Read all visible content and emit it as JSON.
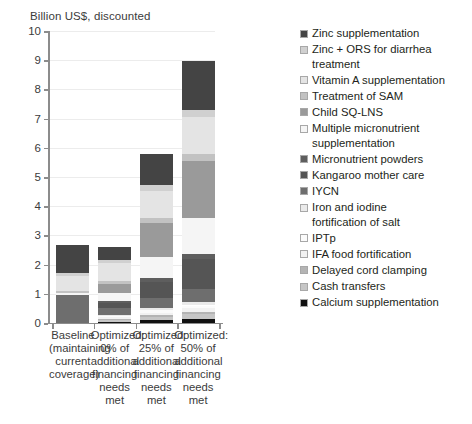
{
  "chart_data": {
    "type": "bar",
    "subtype": "stacked-vertical",
    "title": "Billion US$, discounted",
    "xlabel": "",
    "ylabel": "Billion US$, discounted",
    "ylim": [
      0,
      10
    ],
    "ytick_labels": [
      "0",
      "1",
      "2",
      "3",
      "4",
      "5",
      "6",
      "7",
      "8",
      "9",
      "10"
    ],
    "ytick_values": [
      0,
      1,
      2,
      3,
      4,
      5,
      6,
      7,
      8,
      9,
      10
    ],
    "grid": true,
    "legend_position": "right",
    "categories": [
      "Baseline\n(maintaining\ncurrent\ncoverage)",
      "Optimized:\n0% of\nadditional\nfinancing\nneeds met",
      "Optimized:\n25% of\nadditional\nfinancing\nneeds met",
      "Optimized:\n50% of\nadditional\nfinancing\nneeds met"
    ],
    "totals": [
      2.68,
      2.62,
      5.9,
      8.97
    ],
    "series": [
      {
        "name": "Calcium supplementation",
        "color": "#111111",
        "values": [
          0.0,
          0.05,
          0.1,
          0.13
        ]
      },
      {
        "name": "Cash transfers",
        "color": "#c6c6c6",
        "values": [
          0.0,
          0.06,
          0.12,
          0.17
        ]
      },
      {
        "name": "Delayed cord clamping",
        "color": "#b4b4b4",
        "values": [
          0.0,
          0.03,
          0.05,
          0.07
        ]
      },
      {
        "name": "IFA food fortification",
        "color": "#f2f2f2",
        "values": [
          0.0,
          0.05,
          0.09,
          0.13
        ]
      },
      {
        "name": "IPTp",
        "color": "#fbfbfb",
        "values": [
          0.0,
          0.04,
          0.07,
          0.1
        ]
      },
      {
        "name": "Iron and iodine\nfortification of salt",
        "color": "#eaeaea",
        "values": [
          0.0,
          0.05,
          0.08,
          0.12
        ]
      },
      {
        "name": "IYCN",
        "color": "#6e6e6e",
        "values": [
          0.97,
          0.22,
          0.33,
          0.44
        ]
      },
      {
        "name": "Kangaroo mother care",
        "color": "#555555",
        "values": [
          0.0,
          0.18,
          0.58,
          1.02
        ]
      },
      {
        "name": "Micronutrient powders",
        "color": "#5e5e5e",
        "values": [
          0.0,
          0.07,
          0.13,
          0.19
        ]
      },
      {
        "name": "Multiple micronutrient\nsupplementation",
        "color": "#f5f5f5",
        "values": [
          0.05,
          0.27,
          0.72,
          1.22
        ]
      },
      {
        "name": "Child SQ-LNS",
        "color": "#9a9a9a",
        "values": [
          0.0,
          0.3,
          1.15,
          1.96
        ]
      },
      {
        "name": "Treatment of SAM",
        "color": "#c2c2c2",
        "values": [
          0.09,
          0.11,
          0.18,
          0.25
        ]
      },
      {
        "name": "Vitamin A supplementation",
        "color": "#e4e4e4",
        "values": [
          0.49,
          0.62,
          0.93,
          1.25
        ]
      },
      {
        "name": "Zinc + ORS for diarrhea\ntreatment",
        "color": "#d0d0d0",
        "values": [
          0.1,
          0.12,
          0.18,
          0.24
        ]
      },
      {
        "name": "Zinc supplementation",
        "color": "#444444",
        "values": [
          0.98,
          0.45,
          1.09,
          1.68
        ]
      }
    ]
  },
  "legend": {
    "items": [
      {
        "label": "Zinc supplementation",
        "swatch": "#444444"
      },
      {
        "label": "Zinc + ORS for diarrhea\ntreatment",
        "swatch": "#d0d0d0"
      },
      {
        "label": "Vitamin A supplementation",
        "swatch": "#e4e4e4"
      },
      {
        "label": "Treatment of SAM",
        "swatch": "#c2c2c2"
      },
      {
        "label": "Child SQ-LNS",
        "swatch": "#9a9a9a"
      },
      {
        "label": "Multiple micronutrient\nsupplementation",
        "swatch": "#f5f5f5"
      },
      {
        "label": "Micronutrient powders",
        "swatch": "#5e5e5e"
      },
      {
        "label": "Kangaroo mother care",
        "swatch": "#555555"
      },
      {
        "label": "IYCN",
        "swatch": "#6e6e6e"
      },
      {
        "label": "Iron and iodine\nfortification of salt",
        "swatch": "#eaeaea"
      },
      {
        "label": "IPTp",
        "swatch": "#fbfbfb"
      },
      {
        "label": "IFA food fortification",
        "swatch": "#f2f2f2"
      },
      {
        "label": "Delayed cord clamping",
        "swatch": "#b4b4b4"
      },
      {
        "label": "Cash transfers",
        "swatch": "#c6c6c6"
      },
      {
        "label": "Calcium supplementation",
        "swatch": "#111111"
      }
    ]
  },
  "footnote": ""
}
